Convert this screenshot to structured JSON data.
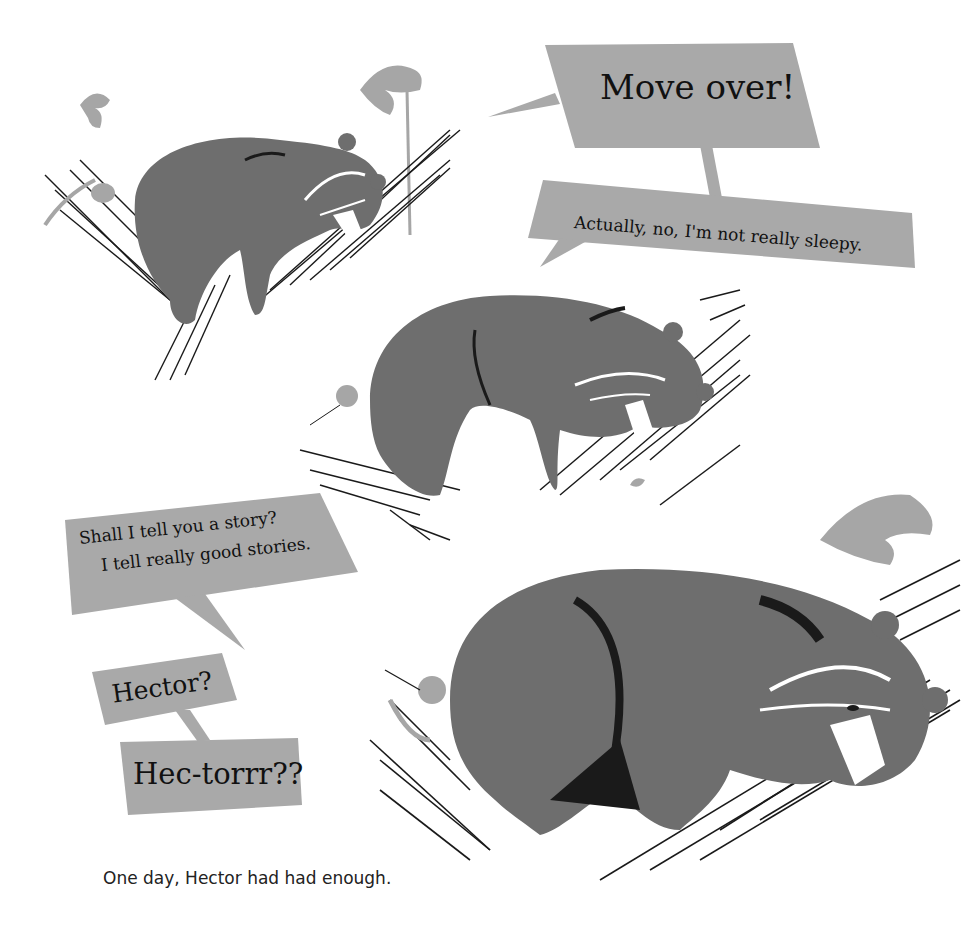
{
  "page": {
    "caption": "One day, Hector had had enough.",
    "colors": {
      "background": "#ffffff",
      "bubble": "#a9a9a9",
      "bear": "#6e6e6e",
      "bear_shadow": "#1a1a1a",
      "foliage": "#a6a6a6",
      "branch_ink": "#1a1a1a"
    }
  },
  "speech_bubbles": [
    {
      "id": "move-over",
      "text": "Move over!"
    },
    {
      "id": "not-sleepy",
      "text": "Actually, no, I'm not really sleepy."
    },
    {
      "id": "story",
      "line1": "Shall I tell you a story?",
      "line2": "I tell really good stories."
    },
    {
      "id": "hector",
      "text": "Hector?"
    },
    {
      "id": "hec-torrr",
      "text": "Hec-torrr??"
    }
  ],
  "illustrations": [
    {
      "id": "bear-1",
      "label": "bear sleeping on branch with hummingbird"
    },
    {
      "id": "bear-2",
      "label": "bear sleeping on branch, hummingbird nudging"
    },
    {
      "id": "bear-3",
      "label": "large bear asleep on branch, hummingbird pushing"
    }
  ]
}
